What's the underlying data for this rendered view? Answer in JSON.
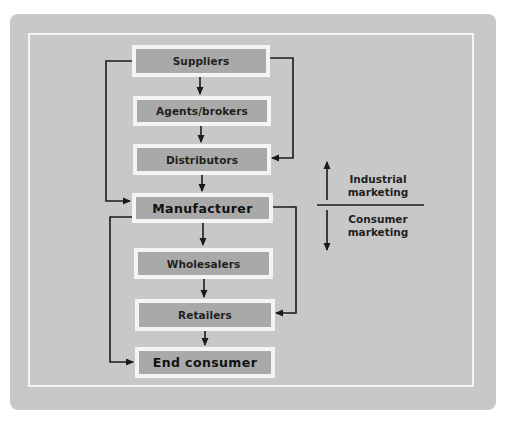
{
  "diagram": {
    "nodes": [
      {
        "id": "suppliers",
        "label": "Suppliers"
      },
      {
        "id": "agents_brokers",
        "label": "Agents/brokers"
      },
      {
        "id": "distributors",
        "label": "Distributors"
      },
      {
        "id": "manufacturer",
        "label": "Manufacturer"
      },
      {
        "id": "wholesalers",
        "label": "Wholesalers"
      },
      {
        "id": "retailers",
        "label": "Retailers"
      },
      {
        "id": "end_consumer",
        "label": "End consumer"
      }
    ],
    "edges": [
      {
        "from": "suppliers",
        "to": "agents_brokers"
      },
      {
        "from": "agents_brokers",
        "to": "distributors"
      },
      {
        "from": "distributors",
        "to": "manufacturer"
      },
      {
        "from": "manufacturer",
        "to": "wholesalers"
      },
      {
        "from": "wholesalers",
        "to": "retailers"
      },
      {
        "from": "retailers",
        "to": "end_consumer"
      },
      {
        "from": "suppliers",
        "to": "manufacturer",
        "route": "left-bypass"
      },
      {
        "from": "suppliers",
        "to": "distributors",
        "route": "right-bypass"
      },
      {
        "from": "manufacturer",
        "to": "end_consumer",
        "route": "left-bypass"
      },
      {
        "from": "manufacturer",
        "to": "retailers",
        "route": "right-bypass"
      }
    ],
    "legend": {
      "upper": {
        "line1": "Industrial",
        "line2": "marketing",
        "direction": "up"
      },
      "lower": {
        "line1": "Consumer",
        "line2": "marketing",
        "direction": "down"
      }
    },
    "colors": {
      "panel": "#c8c8c8",
      "box": "#a9a9a9",
      "box_border": "#f4f4f4",
      "line": "#1a1a1a"
    }
  }
}
